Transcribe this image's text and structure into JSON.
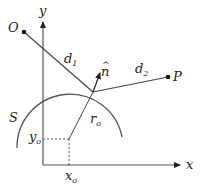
{
  "diagram": {
    "axes": {
      "x_label": "x",
      "y_label": "y"
    },
    "points": {
      "origin_point": "O",
      "target_point": "P"
    },
    "labels": {
      "d1": "d",
      "d1_sub": "1",
      "d2": "d",
      "d2_sub": "2",
      "normal": "n",
      "normal_hat": "^",
      "surface": "S",
      "radius": "r",
      "radius_sub": "o",
      "x0": "x",
      "x0_sub": "o",
      "y0": "y",
      "y0_sub": "o"
    },
    "colors": {
      "stroke": "#333333",
      "axis": "#555555",
      "arc": "#555555"
    }
  }
}
